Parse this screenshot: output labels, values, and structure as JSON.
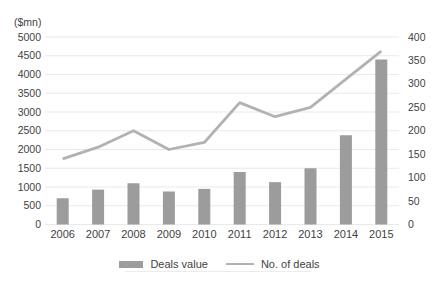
{
  "chart_data": {
    "type": "bar",
    "combo": "bar series on left axis with overlaid line series on right axis",
    "title": "",
    "categories": [
      "2006",
      "2007",
      "2008",
      "2009",
      "2010",
      "2011",
      "2012",
      "2013",
      "2014",
      "2015"
    ],
    "series": [
      {
        "name": "Deals value",
        "type": "bar",
        "axis": "left",
        "values": [
          700,
          930,
          1100,
          880,
          950,
          1400,
          1130,
          1500,
          2380,
          4400
        ]
      },
      {
        "name": "No. of deals",
        "type": "line",
        "axis": "right",
        "values": [
          140,
          165,
          200,
          160,
          175,
          260,
          230,
          250,
          310,
          370
        ]
      }
    ],
    "left_axis": {
      "label": "($mn)",
      "min": 0,
      "max": 5000,
      "step": 500,
      "ticks": [
        "0",
        "500",
        "1000",
        "1500",
        "2000",
        "2500",
        "3000",
        "3500",
        "4000",
        "4500",
        "5000"
      ]
    },
    "right_axis": {
      "min": 0,
      "max": 400,
      "step": 50,
      "ticks": [
        "0",
        "50",
        "100",
        "150",
        "200",
        "250",
        "300",
        "350",
        "400"
      ]
    },
    "grid": "horizontal gridlines only, aligned to left axis",
    "legend_position": "bottom"
  },
  "colors": {
    "bar": "#9c9c9c",
    "line": "#b2b2b2",
    "grid": "#e9e9e9",
    "text": "#3f3f3f",
    "background": "#ffffff"
  }
}
